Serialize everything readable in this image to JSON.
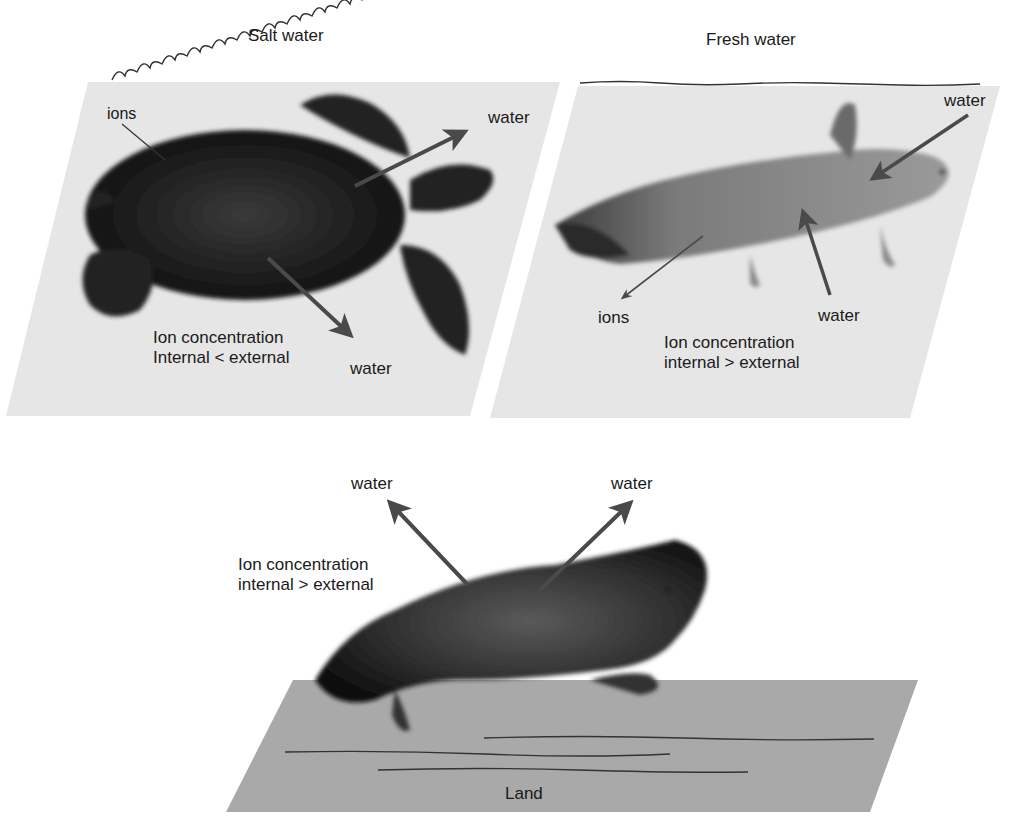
{
  "panels": {
    "salt_water": {
      "title": "Salt water",
      "animal": "sea turtle",
      "labels": {
        "ions": "ions",
        "water_out_1": "water",
        "water_out_2": "water",
        "concentration_line1": "Ion concentration",
        "concentration_line2": "Internal < external"
      }
    },
    "fresh_water": {
      "title": "Fresh water",
      "animal": "axolotl",
      "labels": {
        "water_in_1": "water",
        "water_in_2": "water",
        "ions": "ions",
        "concentration_line1": "Ion concentration",
        "concentration_line2": "internal > external"
      }
    },
    "land": {
      "title": "Land",
      "animal": "horned lizard",
      "labels": {
        "water_out_1": "water",
        "water_out_2": "water",
        "concentration_line1": "Ion concentration",
        "concentration_line2": "internal > external"
      }
    }
  },
  "colors": {
    "panel_bg": "#e6e6e6",
    "land_bg": "#a9a9a9",
    "arrow": "#4a4a4a",
    "animal_dark": "#1e1e1e"
  }
}
